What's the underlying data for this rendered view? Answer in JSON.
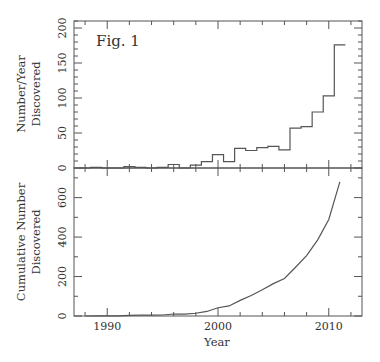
{
  "chart_data": [
    {
      "panel": "top",
      "type": "bar",
      "style": "step-histogram",
      "annotation": "Fig. 1",
      "title": "",
      "xlabel": "",
      "ylabel": "Number/Year Discovered",
      "ylabel_lines": [
        "Number/Year",
        "Discovered"
      ],
      "ylim": [
        0,
        210
      ],
      "xlim": [
        1987,
        2013
      ],
      "yticks": [
        0,
        50,
        100,
        150,
        200
      ],
      "yticks_minor_step": 10,
      "grid": false,
      "categories": [
        1988,
        1989,
        1990,
        1991,
        1992,
        1993,
        1994,
        1995,
        1996,
        1997,
        1998,
        1999,
        2000,
        2001,
        2002,
        2003,
        2004,
        2005,
        2006,
        2007,
        2008,
        2009,
        2010,
        2011
      ],
      "values": [
        0,
        1,
        0,
        0,
        2,
        1,
        0,
        1,
        5,
        0,
        4,
        9,
        19,
        9,
        28,
        25,
        29,
        31,
        26,
        57,
        59,
        80,
        103,
        176
      ]
    },
    {
      "panel": "bottom",
      "type": "line",
      "title": "",
      "xlabel": "Year",
      "ylabel": "Cumulative Number Discovered",
      "ylabel_lines": [
        "Cumulative Number",
        "Discovered"
      ],
      "ylim": [
        0,
        750
      ],
      "xlim": [
        1987,
        2013
      ],
      "yticks": [
        0,
        200,
        400,
        600
      ],
      "yticks_minor_step": 100,
      "xticks": [
        1990,
        2000,
        2010
      ],
      "xticks_minor_step": 2,
      "grid": false,
      "x": [
        1988,
        1989,
        1990,
        1991,
        1992,
        1993,
        1994,
        1995,
        1996,
        1997,
        1998,
        1999,
        2000,
        2001,
        2002,
        2003,
        2004,
        2005,
        2006,
        2007,
        2008,
        2009,
        2010,
        2011
      ],
      "y": [
        0,
        1,
        1,
        1,
        3,
        4,
        4,
        5,
        10,
        10,
        14,
        23,
        42,
        51,
        79,
        104,
        133,
        164,
        190,
        247,
        306,
        386,
        489,
        680
      ]
    }
  ]
}
